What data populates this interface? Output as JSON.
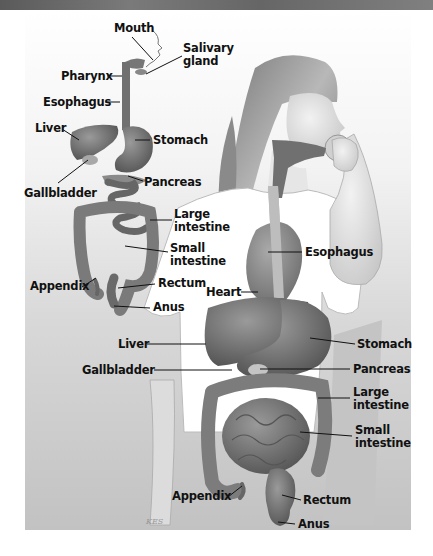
{
  "figure": {
    "colors": {
      "top_band": "#666666",
      "panel_top": "#ffffff",
      "panel_bottom": "#c2c2c2",
      "organ": "#6e6e6e",
      "label_text": "#111111"
    },
    "schematic_labels": {
      "mouth": "Mouth",
      "salivary_gland": [
        "Salivary",
        "gland"
      ],
      "pharynx": "Pharynx",
      "esophagus": "Esophagus",
      "liver": "Liver",
      "stomach": "Stomach",
      "gallbladder": "Gallbladder",
      "pancreas": "Pancreas",
      "large_intestine": [
        "Large",
        "intestine"
      ],
      "small_intestine": [
        "Small",
        "intestine"
      ],
      "appendix": "Appendix",
      "rectum": "Rectum",
      "anus": "Anus"
    },
    "figure_labels": {
      "esophagus": "Esophagus",
      "heart": "Heart",
      "liver": "Liver",
      "stomach": "Stomach",
      "gallbladder": "Gallbladder",
      "pancreas": "Pancreas",
      "large_intestine": [
        "Large",
        "intestine"
      ],
      "small_intestine": [
        "Small",
        "intestine"
      ],
      "appendix": "Appendix",
      "rectum": "Rectum",
      "anus": "Anus"
    },
    "artist_signature": "KES"
  }
}
